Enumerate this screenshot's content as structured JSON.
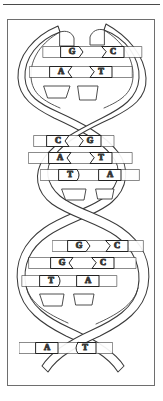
{
  "figure": {
    "title": "DNA double helix",
    "style": "line-drawing",
    "colors": {
      "ink": "#1a1a1a",
      "stroke": "#3a3a3a",
      "frame": "#6e6e6e",
      "rule": "#4a4a4a",
      "background": "#ffffff",
      "fill": "#ffffff"
    },
    "frame": {
      "top_rule": true,
      "border": true
    },
    "strands": {
      "count": 2,
      "left_label": "strand-left",
      "right_label": "strand-right",
      "crossings": 2
    },
    "base_pairs": [
      {
        "index": 1,
        "left": "G",
        "right": "C",
        "y": 52,
        "left_x": 72,
        "right_x": 113,
        "left_shape": "right-arrow",
        "right_shape": "left-notch",
        "row_width": 96
      },
      {
        "index": 2,
        "left": "A",
        "right": "T",
        "y": 72,
        "left_x": 61,
        "right_x": 101,
        "left_shape": "right-notch",
        "right_shape": "left-notch",
        "row_width": 104
      },
      {
        "index": 3,
        "left": "C",
        "right": "G",
        "y": 141,
        "left_x": 58,
        "right_x": 90,
        "left_shape": "right-notch",
        "right_shape": "left-notch",
        "row_width": 80
      },
      {
        "index": 4,
        "left": "A",
        "right": "T",
        "y": 158,
        "left_x": 60,
        "right_x": 101,
        "left_shape": "right-notch",
        "right_shape": "left-notch",
        "row_width": 104
      },
      {
        "index": 5,
        "left": "T",
        "right": "A",
        "y": 175,
        "left_x": 70,
        "right_x": 110,
        "left_shape": "right-round",
        "right_shape": "left-flat",
        "row_width": 98
      },
      {
        "index": 6,
        "left": "G",
        "right": "C",
        "y": 246,
        "left_x": 79,
        "right_x": 117,
        "left_shape": "right-arrow",
        "right_shape": "left-notch",
        "row_width": 88
      },
      {
        "index": 7,
        "left": "G",
        "right": "C",
        "y": 263,
        "left_x": 62,
        "right_x": 103,
        "left_shape": "right-notch",
        "right_shape": "left-notch",
        "row_width": 110
      },
      {
        "index": 8,
        "left": "T",
        "right": "A",
        "y": 281,
        "left_x": 51,
        "right_x": 88,
        "left_shape": "right-round",
        "right_shape": "left-flat",
        "row_width": 96
      },
      {
        "index": 9,
        "left": "A",
        "right": "T",
        "y": 348,
        "left_x": 47,
        "right_x": 85,
        "left_shape": "right-flat",
        "right_shape": "left-round",
        "row_width": 92
      }
    ],
    "sequence_left": "GACATGGTA",
    "sequence_right": "CTGTACCAT"
  }
}
